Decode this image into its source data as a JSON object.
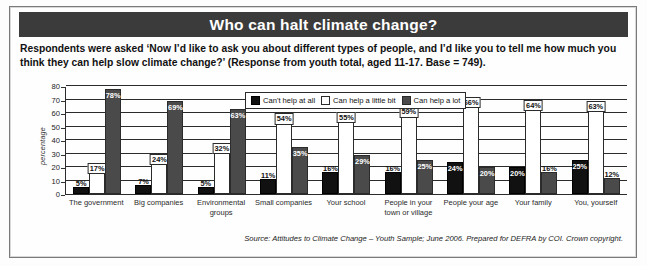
{
  "title": "Who can halt climate change?",
  "intro": "Respondents were asked ‘Now I’d like to ask you about different types of people, and I’d like you to tell me how much you think they can help slow climate change?’ (Response from youth total, aged 11-17. Base = 749).",
  "source": "Source: Attitudes to Climate Change – Youth Sample; June 2006. Prepared for DEFRA by COI. Crown copyright.",
  "colors": {
    "title_bar": "#3b3b3b",
    "series_cant_help": "#111111",
    "series_little_bit": "#ffffff",
    "series_a_lot": "#4a4a4a",
    "axis": "#2b2b2b"
  },
  "chart_data": {
    "type": "bar",
    "title": "Who can halt climate change?",
    "xlabel": "",
    "ylabel": "percentage",
    "ylim": [
      0,
      80
    ],
    "yticks": [
      0,
      10,
      20,
      30,
      40,
      50,
      60,
      70,
      80
    ],
    "grid": true,
    "legend_position": "top-center",
    "categories": [
      "The government",
      "Big companies",
      "Environmental groups",
      "Small companies",
      "Your school",
      "People in your town or village",
      "People your age",
      "Your family",
      "You, yourself"
    ],
    "series": [
      {
        "name": "Can't help at all",
        "color": "#111111",
        "values": [
          5,
          7,
          5,
          11,
          16,
          16,
          24,
          20,
          25
        ],
        "labels": [
          "5%",
          "7%",
          "5%",
          "11%",
          "16%",
          "16%",
          "24%",
          "20%",
          "25%"
        ]
      },
      {
        "name": "Can help a little bit",
        "color": "#ffffff",
        "values": [
          17,
          24,
          32,
          54,
          55,
          59,
          66,
          64,
          63
        ],
        "labels": [
          "17%",
          "24%",
          "32%",
          "54%",
          "55%",
          "59%",
          "66%",
          "64%",
          "63%"
        ]
      },
      {
        "name": "Can help a lot",
        "color": "#4a4a4a",
        "values": [
          78,
          69,
          63,
          35,
          29,
          25,
          20,
          16,
          12
        ],
        "labels": [
          "78%",
          "69%",
          "63%",
          "35%",
          "29%",
          "25%",
          "20%",
          "16%",
          "12%"
        ]
      }
    ]
  }
}
